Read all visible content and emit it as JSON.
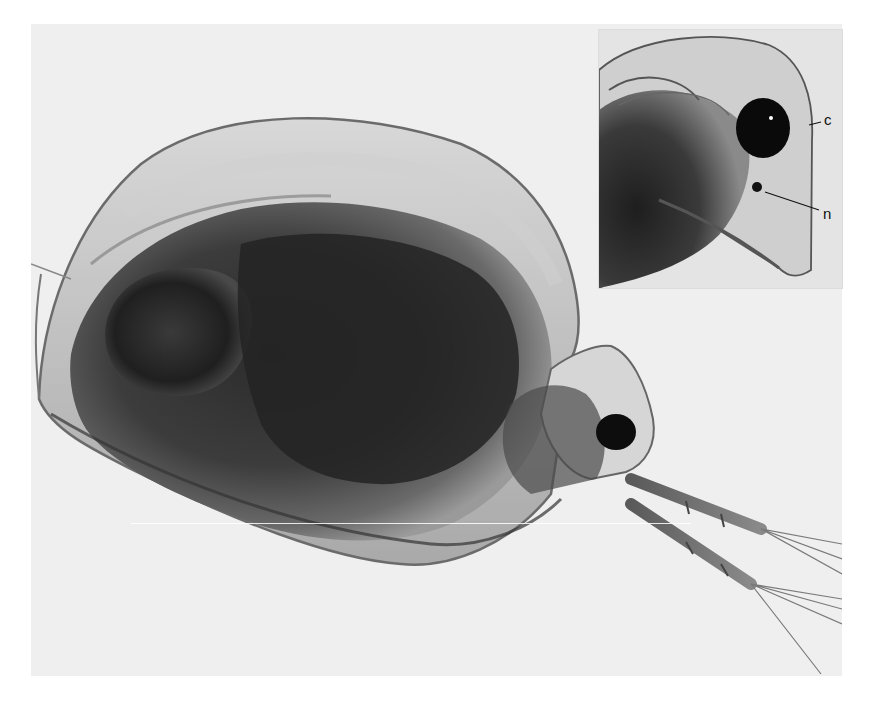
{
  "figure": {
    "main_image": {
      "subject": "water-flea-lateral-view",
      "background_color": "#efefef",
      "body_dark_color": "#2a2a2a",
      "body_mid_color": "#6a6a6a",
      "carapace_light_color": "#bdbdbd"
    },
    "inset": {
      "subject": "head-detail",
      "labels": [
        {
          "id": "c",
          "text": "c"
        },
        {
          "id": "n",
          "text": "n"
        }
      ]
    }
  }
}
